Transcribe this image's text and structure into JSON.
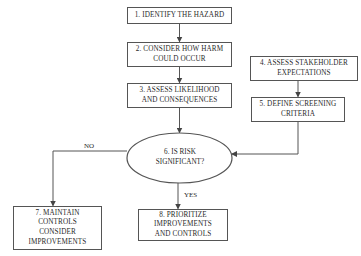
{
  "diagram": {
    "type": "flowchart",
    "nodes": [
      {
        "id": "1",
        "shape": "rect",
        "lines": [
          "1. IDENTIFY THE HAZARD"
        ]
      },
      {
        "id": "2",
        "shape": "rect",
        "lines": [
          "2. CONSIDER HOW HARM",
          "COULD OCCUR"
        ]
      },
      {
        "id": "3",
        "shape": "rect",
        "lines": [
          "3. ASSESS LIKELIHOOD",
          "AND CONSEQUENCES"
        ]
      },
      {
        "id": "4",
        "shape": "rect",
        "lines": [
          "4. ASSESS STAKEHOLDER",
          "EXPECTATIONS"
        ]
      },
      {
        "id": "5",
        "shape": "rect",
        "lines": [
          "5. DEFINE SCREENING",
          "CRITERIA"
        ]
      },
      {
        "id": "6",
        "shape": "ellipse",
        "lines": [
          "6. IS RISK",
          "SIGNIFICANT?"
        ]
      },
      {
        "id": "7",
        "shape": "rect",
        "lines": [
          "7. MAINTAIN",
          "CONTROLS",
          "CONSIDER",
          "IMPROVEMENTS"
        ]
      },
      {
        "id": "8",
        "shape": "rect",
        "lines": [
          "8. PRIORITIZE",
          "IMPROVEMENTS",
          "AND CONTROLS"
        ]
      }
    ],
    "edges": [
      {
        "from": "1",
        "to": "2",
        "label": ""
      },
      {
        "from": "2",
        "to": "3",
        "label": ""
      },
      {
        "from": "3",
        "to": "6",
        "label": ""
      },
      {
        "from": "4",
        "to": "5",
        "label": ""
      },
      {
        "from": "5",
        "to": "6",
        "label": ""
      },
      {
        "from": "6",
        "to": "7",
        "label": "NO"
      },
      {
        "from": "6",
        "to": "8",
        "label": "YES"
      }
    ],
    "edge_labels": {
      "no": "NO",
      "yes": "YES"
    },
    "colors": {
      "stroke": "#555555",
      "text": "#2a2a2a",
      "background": "#ffffff"
    }
  }
}
